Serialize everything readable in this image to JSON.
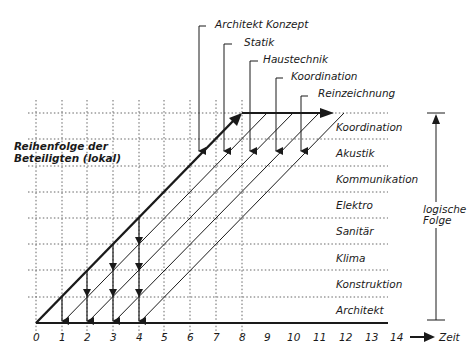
{
  "diagram": {
    "title_left": {
      "line1": "Reihenfolge der",
      "line2": "Beteiligten (lokal)"
    },
    "vertical_axis_label": {
      "line1": "logische",
      "line2": "Folge"
    },
    "time_axis_label": "Zeit",
    "x_ticks": [
      "0",
      "1",
      "2",
      "3",
      "4",
      "5",
      "6",
      "7",
      "8",
      "9",
      "10",
      "11",
      "12",
      "13",
      "14"
    ],
    "rows": [
      "Koordination",
      "Akustik",
      "Kommunikation",
      "Elektro",
      "Sanitär",
      "Klima",
      "Konstruktion",
      "Architekt"
    ],
    "callouts": [
      "Architekt Konzept",
      "Statik",
      "Haustechnik",
      "Koordination",
      "Reinzeichnung"
    ],
    "colors": {
      "line": "#1a1a1a",
      "grid": "#555555",
      "background": "#ffffff"
    }
  }
}
